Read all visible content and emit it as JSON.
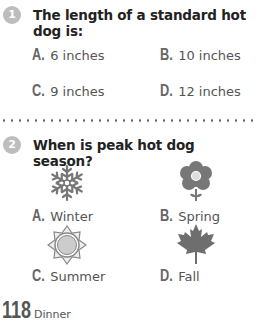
{
  "questions": [
    {
      "number": "1",
      "text": "The length of a standard hot dog is:",
      "options": [
        {
          "letter": "A.",
          "text": "6 inches"
        },
        {
          "letter": "B.",
          "text": "10 inches"
        },
        {
          "letter": "C.",
          "text": "9 inches"
        },
        {
          "letter": "D.",
          "text": "12 inches"
        }
      ]
    },
    {
      "number": "2",
      "text": "When is peak hot dog season?",
      "options": [
        {
          "letter": "A.",
          "text": "Winter",
          "icon": "snowflake-icon"
        },
        {
          "letter": "B.",
          "text": "Spring",
          "icon": "flower-icon"
        },
        {
          "letter": "C.",
          "text": "Summer",
          "icon": "sun-icon"
        },
        {
          "letter": "D.",
          "text": "Fall",
          "icon": "maple-leaf-icon"
        }
      ]
    }
  ],
  "footer": {
    "page_number": "118",
    "section": "Dinner"
  },
  "colors": {
    "badge": "#bdbdbd",
    "icon_fill": "#777777",
    "text": "#555555"
  }
}
